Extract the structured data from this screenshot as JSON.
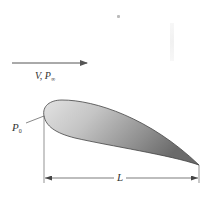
{
  "diagram": {
    "type": "airfoil-flow-schematic",
    "flow": {
      "label_main": "V, P",
      "label_sub": "∞",
      "direction": "left-to-right"
    },
    "leading_edge": {
      "label_main": "P",
      "label_sub": "0"
    },
    "chord": {
      "label": "L"
    },
    "colors": {
      "line": "#555555",
      "airfoil_fill_light": "#d9d9d9",
      "airfoil_fill_dark": "#7a7a7a",
      "outline": "#444444"
    }
  }
}
